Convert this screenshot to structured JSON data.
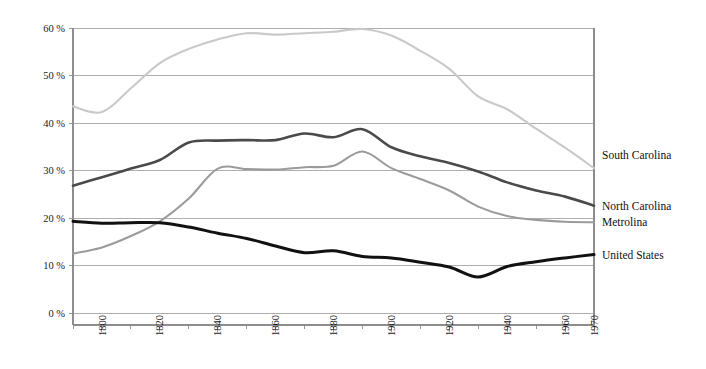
{
  "chart_data": {
    "type": "line",
    "title": "",
    "subtitle": "",
    "xlabel": "",
    "ylabel": "",
    "xlim": [
      1790,
      1970
    ],
    "ylim": [
      0,
      60
    ],
    "grid": true,
    "grid_axis": "y",
    "legend_position": "right-inline",
    "y_ticks": [
      "0 %",
      "10 %",
      "20 %",
      "30 %",
      "40 %",
      "50 %",
      "60 %"
    ],
    "y_tick_values": [
      0,
      10,
      20,
      30,
      40,
      50,
      60
    ],
    "x_ticks": [
      "1800",
      "1820",
      "1840",
      "1860",
      "1880",
      "1900",
      "1920",
      "1940",
      "1960",
      "1970"
    ],
    "x_tick_values": [
      1800,
      1820,
      1840,
      1860,
      1880,
      1900,
      1920,
      1940,
      1960,
      1970
    ],
    "x_minor_step": 10,
    "x": [
      1790,
      1800,
      1810,
      1820,
      1830,
      1840,
      1850,
      1860,
      1870,
      1880,
      1890,
      1900,
      1910,
      1920,
      1930,
      1940,
      1950,
      1960,
      1970
    ],
    "series": [
      {
        "name": "South Carolina",
        "color": "#c9c9c9",
        "width": 2.1,
        "values": [
          43.5,
          42.3,
          47.3,
          52.6,
          55.6,
          57.6,
          58.9,
          58.6,
          58.9,
          59.2,
          59.8,
          58.4,
          55.2,
          51.4,
          45.6,
          42.9,
          38.8,
          34.8,
          30.5
        ]
      },
      {
        "name": "North Carolina",
        "color": "#4a4a4a",
        "width": 2.6,
        "values": [
          26.8,
          28.6,
          30.4,
          32.2,
          35.9,
          36.3,
          36.4,
          36.4,
          37.8,
          37.0,
          38.7,
          34.9,
          33.0,
          31.6,
          29.8,
          27.5,
          25.8,
          24.5,
          22.6
        ]
      },
      {
        "name": "Metrolina",
        "color": "#9b9b9b",
        "width": 2.1,
        "values": [
          12.5,
          13.8,
          16.2,
          19.3,
          24.1,
          30.4,
          30.3,
          30.2,
          30.7,
          31.0,
          34.0,
          30.5,
          28.2,
          25.8,
          22.4,
          20.4,
          19.6,
          19.2,
          19.1
        ]
      },
      {
        "name": "United States",
        "color": "#111111",
        "width": 3.0,
        "values": [
          19.3,
          18.9,
          19.0,
          19.0,
          18.1,
          16.8,
          15.7,
          14.1,
          12.7,
          13.1,
          11.9,
          11.6,
          10.7,
          9.7,
          7.6,
          9.8,
          10.8,
          11.6,
          12.3
        ]
      }
    ],
    "series_labels": [
      {
        "name": "South Carolina",
        "y_value": 33.2
      },
      {
        "name": "North Carolina",
        "y_value": 22.6
      },
      {
        "name": "Metrolina",
        "y_value": 19.1
      },
      {
        "name": "United States",
        "y_value": 12.3
      }
    ]
  }
}
